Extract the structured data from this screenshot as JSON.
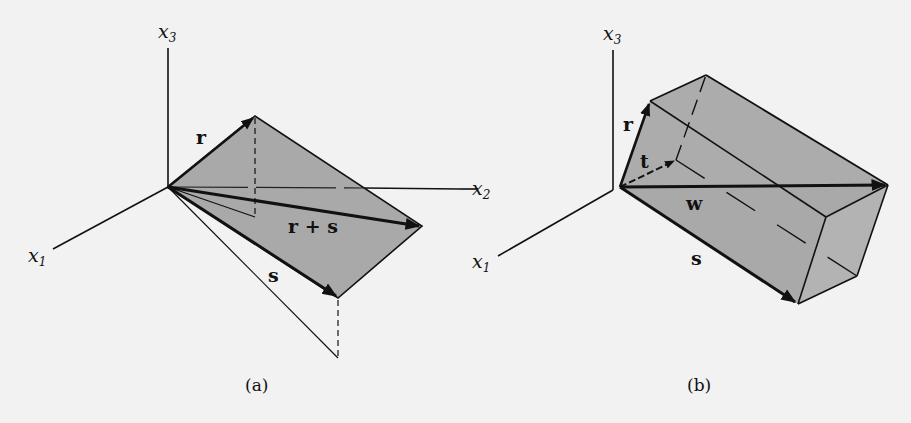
{
  "figure": {
    "colors": {
      "background": "#f2f2f2",
      "face_fill": "#a9a9a9",
      "face_fill_light": "#b3b3b3",
      "ink": "#111111"
    },
    "panel_a": {
      "caption": "(a)",
      "axes": {
        "x1": {
          "var": "x",
          "sub": "1"
        },
        "x2": {
          "var": "x",
          "sub": "2"
        },
        "x3": {
          "var": "x",
          "sub": "3"
        }
      },
      "vectors": {
        "r": "r",
        "s": "s",
        "sum": "r + s"
      }
    },
    "panel_b": {
      "caption": "(b)",
      "axes": {
        "x1": {
          "var": "x",
          "sub": "1"
        },
        "x3": {
          "var": "x",
          "sub": "3"
        }
      },
      "vectors": {
        "r": "r",
        "s": "s",
        "t": "t",
        "w": "w"
      }
    }
  }
}
